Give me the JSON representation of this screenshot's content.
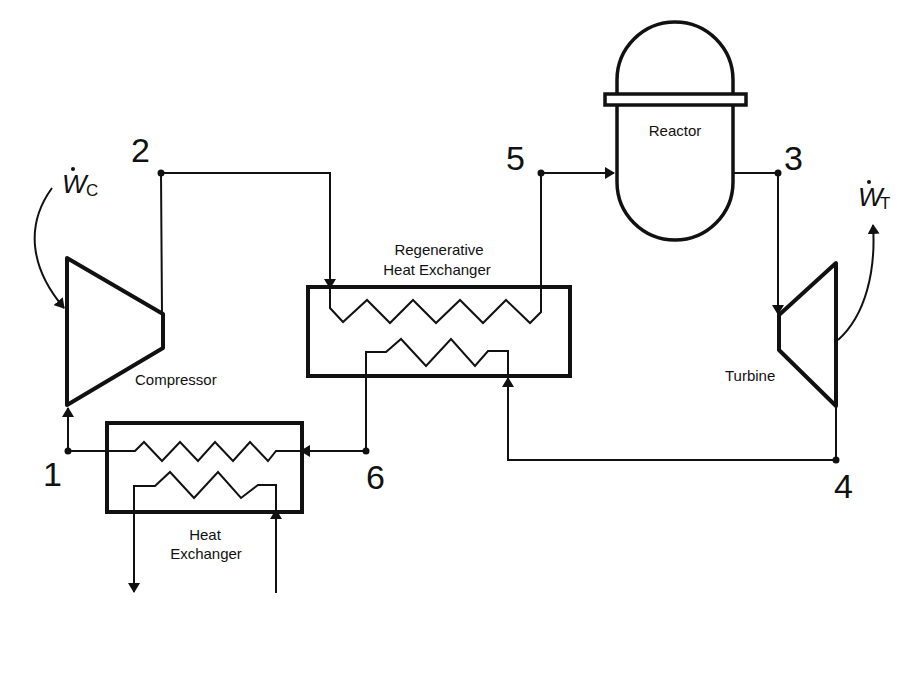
{
  "diagram": {
    "type": "closed gas power cycle with regenerator (nuclear reactor)",
    "components": {
      "compressor": {
        "label": "Compressor"
      },
      "turbine": {
        "label": "Turbine"
      },
      "reactor": {
        "label": "Reactor"
      },
      "regenerator": {
        "label_line1": "Regenerative",
        "label_line2": "Heat Exchanger"
      },
      "heat_exchanger": {
        "label_line1": "Heat",
        "label_line2": "Exchanger"
      }
    },
    "work": {
      "compressor": {
        "symbol": "W",
        "subscript": "C",
        "direction": "in"
      },
      "turbine": {
        "symbol": "W",
        "subscript": "T",
        "direction": "out"
      }
    },
    "states": [
      "1",
      "2",
      "3",
      "4",
      "5",
      "6"
    ],
    "flow_path": [
      "1 → Compressor → 2",
      "2 → Regenerative Heat Exchanger (cold side) → 5",
      "5 → Reactor → 3",
      "3 → Turbine → 4",
      "4 → Regenerative Heat Exchanger (hot side) → 6",
      "6 → Heat Exchanger → 1"
    ]
  },
  "colors": {
    "stroke": "#111111",
    "background": "#ffffff"
  }
}
